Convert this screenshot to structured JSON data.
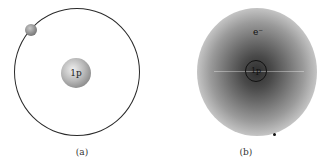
{
  "figure": {
    "panels": [
      {
        "id": "a",
        "caption": "(a)",
        "model": "Bohr orbit model of hydrogen",
        "nucleus_label": "1p",
        "elements": [
          "circular-orbit",
          "electron-sphere",
          "nucleus-sphere"
        ]
      },
      {
        "id": "b",
        "caption": "(b)",
        "model": "Electron cloud model of hydrogen",
        "nucleus_label": "1p",
        "electron_label": "e⁻",
        "elements": [
          "electron-density-cloud",
          "nucleus-circle",
          "electron-label"
        ]
      }
    ]
  }
}
